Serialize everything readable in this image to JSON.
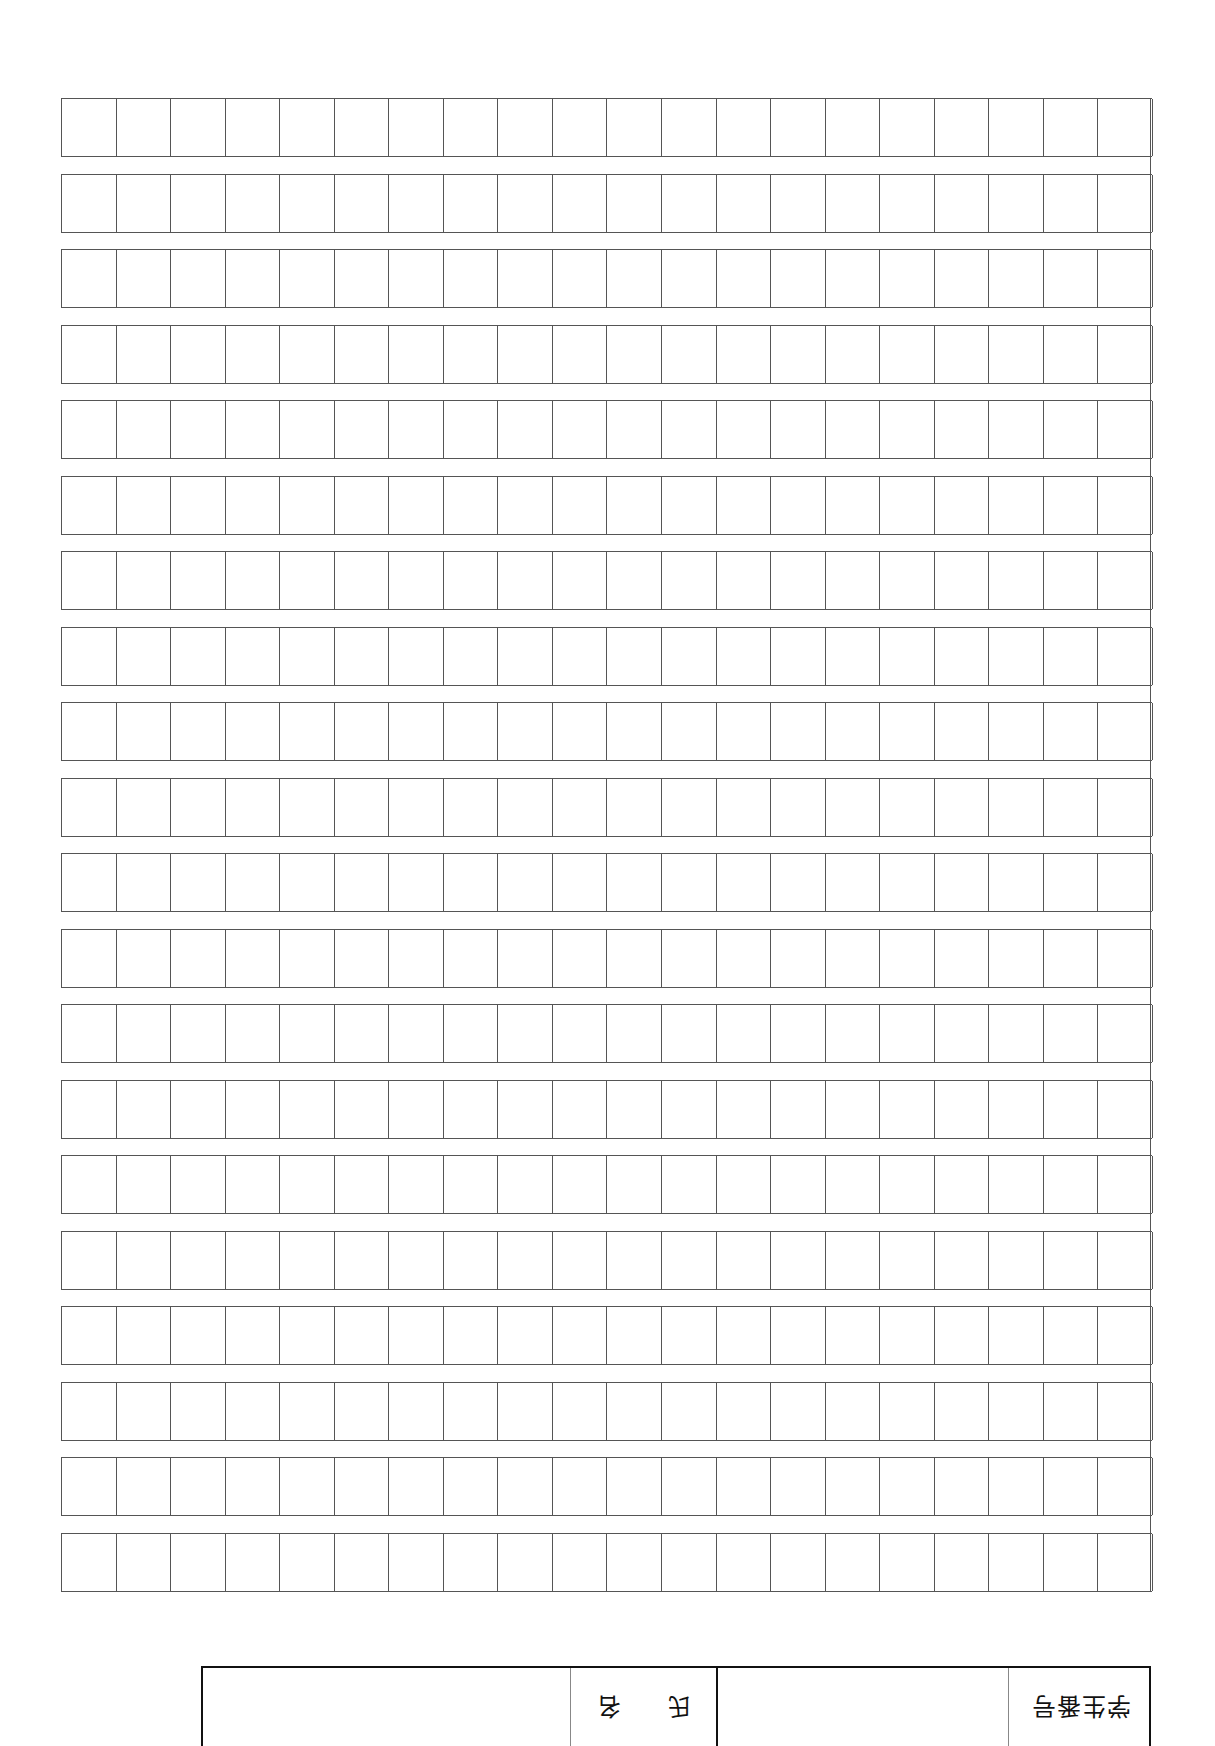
{
  "document": {
    "type": "genkou-youshi manuscript sheet",
    "grid": {
      "rows": 20,
      "columns": 20,
      "total_cells": 400,
      "line_color": "#555555"
    },
    "info_table": {
      "orientation": "rotated 180deg",
      "student_number": {
        "label": "学生番号",
        "value": ""
      },
      "name": {
        "label_chars": [
          "氏",
          "名"
        ],
        "label": "氏名",
        "value": ""
      },
      "border_color": "#111111"
    }
  }
}
